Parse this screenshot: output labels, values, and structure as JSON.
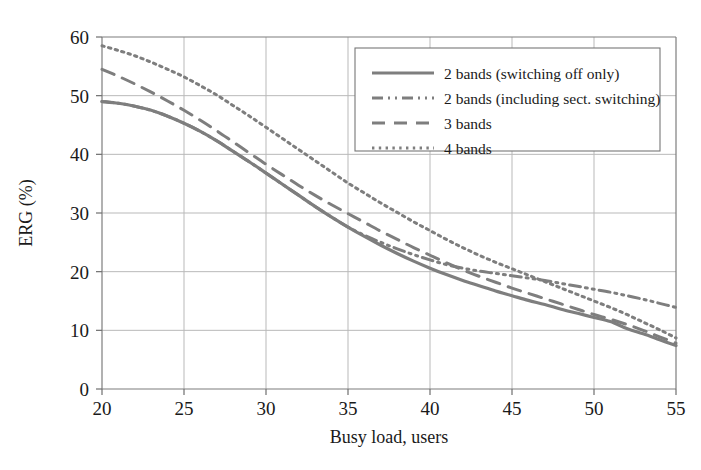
{
  "chart_data": {
    "type": "line",
    "title": "",
    "xlabel": "Busy load, users",
    "ylabel": "ERG (%)",
    "xlim": [
      20,
      55
    ],
    "ylim": [
      0,
      60
    ],
    "xticks": [
      20,
      25,
      30,
      35,
      40,
      45,
      50,
      55
    ],
    "yticks": [
      0,
      10,
      20,
      30,
      40,
      50,
      60
    ],
    "xtick_labels": [
      "20",
      "25",
      "30",
      "35",
      "40",
      "45",
      "50",
      "55"
    ],
    "ytick_labels": [
      "0",
      "10",
      "20",
      "30",
      "40",
      "50",
      "60"
    ],
    "grid": true,
    "legend_position": "upper right",
    "line_color": "#7e7e7e",
    "x": [
      20,
      21,
      22,
      23,
      24,
      25,
      26,
      27,
      28,
      29,
      30,
      31,
      32,
      33,
      34,
      35,
      36,
      37,
      38,
      39,
      40,
      41,
      42,
      43,
      44,
      45,
      46,
      47,
      48,
      49,
      50,
      51,
      52,
      53,
      54,
      55
    ],
    "series": [
      {
        "name": "2 bands (switching off only)",
        "dash": "solid",
        "values": [
          49.0,
          48.7,
          48.2,
          47.5,
          46.5,
          45.3,
          43.9,
          42.3,
          40.5,
          38.7,
          36.8,
          34.9,
          33.0,
          31.1,
          29.3,
          27.6,
          26.0,
          24.5,
          23.1,
          21.8,
          20.6,
          19.5,
          18.5,
          17.6,
          16.7,
          15.9,
          15.1,
          14.4,
          13.6,
          12.9,
          12.2,
          11.5,
          10.3,
          9.4,
          8.4,
          7.4
        ]
      },
      {
        "name": "2 bands (including sect. switching)",
        "dash": "dashdotdot",
        "values": [
          49.0,
          48.7,
          48.2,
          47.5,
          46.5,
          45.3,
          43.9,
          42.3,
          40.5,
          38.7,
          36.8,
          34.9,
          33.0,
          31.1,
          29.3,
          27.6,
          26.2,
          25.0,
          23.9,
          22.9,
          22.0,
          21.2,
          20.6,
          20.1,
          19.7,
          19.3,
          18.9,
          18.5,
          18.0,
          17.5,
          17.0,
          16.5,
          15.9,
          15.3,
          14.6,
          13.9
        ]
      },
      {
        "name": "3 bands",
        "dash": "longdash",
        "values": [
          54.5,
          53.3,
          52.0,
          50.6,
          49.1,
          47.5,
          45.8,
          44.0,
          42.1,
          40.2,
          38.3,
          36.5,
          34.7,
          33.0,
          31.4,
          29.9,
          28.4,
          26.9,
          25.5,
          24.1,
          22.8,
          21.5,
          20.3,
          19.2,
          18.2,
          17.2,
          16.3,
          15.4,
          14.5,
          13.6,
          12.7,
          11.9,
          11.0,
          10.0,
          8.9,
          7.8
        ]
      },
      {
        "name": "4 bands",
        "dash": "dotted",
        "values": [
          58.5,
          57.7,
          56.8,
          55.7,
          54.5,
          53.2,
          51.7,
          50.1,
          48.3,
          46.5,
          44.6,
          42.7,
          40.8,
          38.9,
          37.0,
          35.1,
          33.4,
          31.7,
          30.1,
          28.5,
          27.0,
          25.5,
          24.1,
          22.8,
          21.6,
          20.5,
          19.4,
          18.3,
          17.2,
          16.1,
          15.0,
          13.9,
          12.7,
          11.4,
          10.1,
          8.7
        ]
      }
    ]
  },
  "legend": {
    "entries": [
      {
        "label": "2 bands (switching off only)",
        "style": "solid"
      },
      {
        "label": "2 bands (including sect. switching)",
        "style": "dashdotdot"
      },
      {
        "label": "3 bands",
        "style": "longdash"
      },
      {
        "label": "4 bands",
        "style": "dotted"
      }
    ]
  }
}
